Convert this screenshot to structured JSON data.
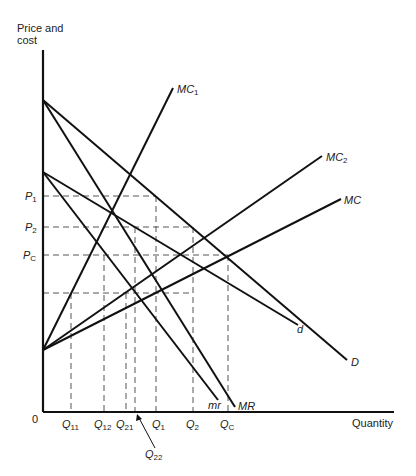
{
  "diagram": {
    "type": "economics-oligopoly-cost-demand",
    "axes": {
      "y_label_line1": "Price and",
      "y_label_line2": "cost",
      "x_label": "Quantity",
      "origin": "0"
    },
    "price_levels": [
      {
        "name": "P",
        "sub": "1"
      },
      {
        "name": "P",
        "sub": "2"
      },
      {
        "name": "P",
        "sub": "C"
      }
    ],
    "quantity_levels": [
      {
        "name": "Q",
        "sub": "11"
      },
      {
        "name": "Q",
        "sub": "12"
      },
      {
        "name": "Q",
        "sub": "21"
      },
      {
        "name": "Q",
        "sub": "22"
      },
      {
        "name": "Q",
        "sub": "1"
      },
      {
        "name": "Q",
        "sub": "2"
      },
      {
        "name": "Q",
        "sub": "C"
      }
    ],
    "curves": [
      {
        "name": "MC",
        "sub": "1"
      },
      {
        "name": "MC",
        "sub": "2"
      },
      {
        "name": "MC",
        "sub": ""
      },
      {
        "name": "d",
        "sub": ""
      },
      {
        "name": "D",
        "sub": ""
      },
      {
        "name": "mr",
        "sub": ""
      },
      {
        "name": "MR",
        "sub": ""
      }
    ]
  }
}
